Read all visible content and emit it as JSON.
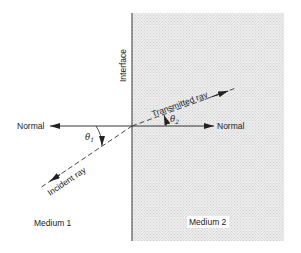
{
  "diagram": {
    "labels": {
      "interface": "Interface",
      "normal_left": "Normal",
      "normal_right": "Normal",
      "incident_ray": "Incident ray",
      "transmitted_ray": "Transmitted ray",
      "theta1": "θ",
      "theta1_sub": "1",
      "theta2": "θ",
      "theta2_sub": "2",
      "medium1": "Medium 1",
      "medium2": "Medium 2"
    },
    "colors": {
      "line": "#222222",
      "medium2_fill": "#e6e6e6",
      "medium2_dots": "#cfcfcf",
      "background": "#ffffff"
    }
  }
}
